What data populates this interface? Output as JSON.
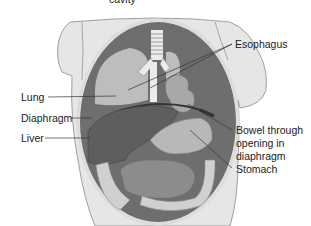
{
  "figure": {
    "caption_fragment": "cavity",
    "colors": {
      "background": "#ffffff",
      "skin": "#e6e6e6",
      "skin_outline": "#8a8a8a",
      "cavity_dark": "#6e6e6e",
      "lung": "#bdbdbd",
      "liver": "#5e5e5e",
      "stomach": "#b8b8b8",
      "intestine": "#8c8c8c",
      "colon": "#d0d0d0",
      "esophagus": "#ececec",
      "leader_line": "#333333",
      "text": "#222222"
    },
    "labels": {
      "esophagus": "Esophagus",
      "lung": "Lung",
      "diaphragm": "Diaphragm",
      "liver": "Liver",
      "bowel_line1": "Bowel through",
      "bowel_line2": "opening in",
      "bowel_line3": "diaphragm",
      "stomach": "Stomach"
    }
  }
}
